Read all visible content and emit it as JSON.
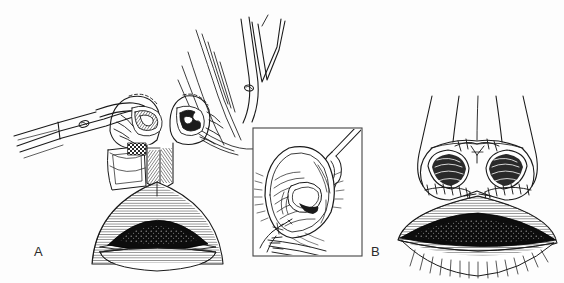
{
  "figure": {
    "kind": "line-art medical illustration",
    "title": "",
    "background_color": "#fdfdfd",
    "ink_color": "#1a1a1a",
    "width": 564,
    "height": 283
  },
  "panels": [
    {
      "id": "A",
      "label": "A",
      "label_position": {
        "x": 34,
        "y": 245
      },
      "caption": "",
      "description": "Intraoperative view of the nasal base and upper lip with the alar cartilages exposed; a pair of tissue forceps retracts from the left and a second instrument from the upper right, the nostril rims elevated and the lip shown open below.",
      "elements": [
        {
          "name": "left-forceps",
          "label": ""
        },
        {
          "name": "right-forceps",
          "label": ""
        },
        {
          "name": "left-alar-dome",
          "label": ""
        },
        {
          "name": "right-alar-dome",
          "label": ""
        },
        {
          "name": "columella-flap",
          "label": ""
        },
        {
          "name": "mucosal-graft-patch",
          "label": ""
        },
        {
          "name": "upper-lip",
          "label": ""
        },
        {
          "name": "oral-opening",
          "label": ""
        },
        {
          "name": "lower-lip",
          "label": ""
        },
        {
          "name": "philtral-suture-line",
          "label": ""
        }
      ]
    },
    {
      "id": "inset",
      "label": "",
      "label_position": {
        "x": 0,
        "y": 0
      },
      "caption": "",
      "description": "Boxed magnified detail: a single nostril retracted with a double skin hook showing the rim incision and a suture tail exiting at the nostril sill.",
      "box": {
        "x": 253,
        "y": 128,
        "width": 109,
        "height": 128
      },
      "elements": [
        {
          "name": "skin-hook",
          "label": ""
        },
        {
          "name": "nostril-rim",
          "label": ""
        },
        {
          "name": "nostril-aperture",
          "label": ""
        },
        {
          "name": "suture-knot",
          "label": ""
        },
        {
          "name": "suture-tails",
          "label": ""
        }
      ]
    },
    {
      "id": "B",
      "label": "B",
      "label_position": {
        "x": 371,
        "y": 245
      },
      "caption": "",
      "description": "Completed repair, frontal view: symmetric nostrils with interrupted sutures around the alar bases, along the columella and down the philtrum into the repaired upper lip.",
      "elements": [
        {
          "name": "nasal-dorsum",
          "label": ""
        },
        {
          "name": "nasal-tip",
          "label": ""
        },
        {
          "name": "left-nostril",
          "label": ""
        },
        {
          "name": "right-nostril",
          "label": ""
        },
        {
          "name": "left-alar-base-sutures",
          "label": ""
        },
        {
          "name": "right-alar-base-sutures",
          "label": ""
        },
        {
          "name": "columellar-suture-line",
          "label": ""
        },
        {
          "name": "philtral-suture-line",
          "label": ""
        },
        {
          "name": "upper-lip",
          "label": ""
        },
        {
          "name": "oral-opening",
          "label": ""
        },
        {
          "name": "lower-lip",
          "label": ""
        }
      ]
    }
  ]
}
